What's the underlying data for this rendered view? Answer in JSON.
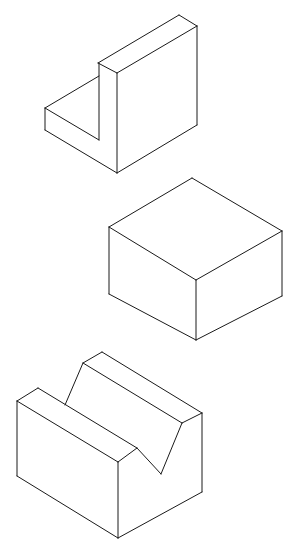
{
  "figure": {
    "background": "#ffffff",
    "stroke_color": "#1a1a1a",
    "shapes": [
      {
        "name": "l-bracket-block",
        "faces": [
          "45,108 99,76 99,140 45,130",
          "98,63 179,15 197,26 117,73",
          "117,73 197,26 197,125 117,173",
          "98,63 117,73 117,173 99,163"
        ],
        "edges": [
          [
            45,
            108,
            99,
            76
          ],
          [
            45,
            108,
            45,
            130
          ],
          [
            45,
            130,
            117,
            173
          ],
          [
            45,
            108,
            99,
            140
          ],
          [
            99,
            140,
            99,
            63
          ],
          [
            98,
            63,
            179,
            15
          ],
          [
            179,
            15,
            197,
            26
          ],
          [
            98,
            63,
            117,
            73
          ],
          [
            117,
            73,
            197,
            26
          ],
          [
            117,
            73,
            117,
            173
          ],
          [
            197,
            26,
            197,
            125
          ],
          [
            197,
            125,
            117,
            173
          ]
        ]
      },
      {
        "name": "cube-block",
        "edges": [
          [
            109,
            227,
            192,
            178
          ],
          [
            192,
            178,
            282,
            231
          ],
          [
            282,
            231,
            196,
            280
          ],
          [
            196,
            280,
            109,
            227
          ],
          [
            109,
            227,
            109,
            294
          ],
          [
            196,
            280,
            196,
            340
          ],
          [
            282,
            231,
            282,
            296
          ],
          [
            109,
            294,
            196,
            340
          ],
          [
            196,
            340,
            282,
            296
          ]
        ]
      },
      {
        "name": "v-block",
        "edges": [
          [
            17,
            401,
            38,
            388
          ],
          [
            17,
            401,
            118,
            462
          ],
          [
            38,
            388,
            137,
            448
          ],
          [
            118,
            462,
            137,
            448
          ],
          [
            65,
            405,
            83,
            363
          ],
          [
            83,
            363,
            102,
            352
          ],
          [
            83,
            363,
            182,
            423
          ],
          [
            102,
            352,
            202,
            413
          ],
          [
            202,
            413,
            182,
            423
          ],
          [
            137,
            448,
            161,
            474
          ],
          [
            161,
            474,
            182,
            423
          ],
          [
            17,
            401,
            17,
            476
          ],
          [
            118,
            462,
            118,
            538
          ],
          [
            202,
            413,
            202,
            492
          ],
          [
            17,
            476,
            118,
            538
          ],
          [
            118,
            538,
            202,
            492
          ]
        ]
      }
    ]
  }
}
